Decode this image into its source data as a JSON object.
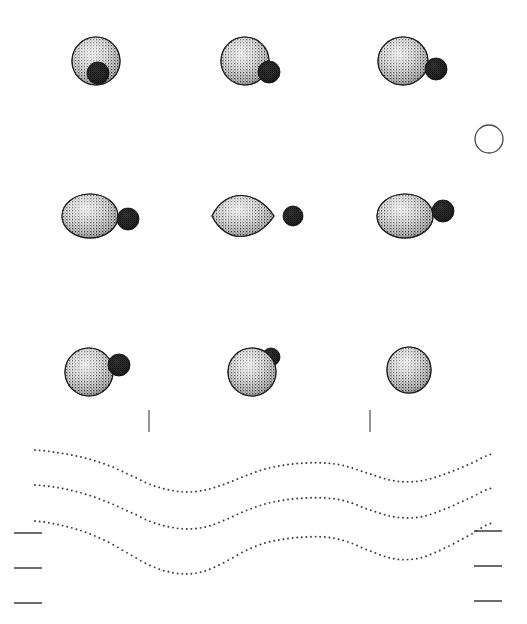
{
  "figure": {
    "title": "",
    "background_color": "#ffffff",
    "width": 527,
    "height": 624,
    "body_fill_color": "#b9b9b9",
    "body_stroke_color": "#1a1a1a",
    "companion_fill_color": "#0d0d0d",
    "companion_stroke_color": "#000000",
    "reference_circle_stroke_color": "#4a4a4a",
    "tick_color": "#3a3a3a",
    "curve_dot_color": "#333333"
  },
  "panels": [
    {
      "id": "panel-r1c1",
      "label": "row-1-col-1",
      "row": 1,
      "column": 1,
      "primary": {
        "cx": 96,
        "cy": 61,
        "rx": 24,
        "ry": 24,
        "rotation": 0,
        "shading": "dithered-sphere"
      },
      "companion": {
        "cx": 98,
        "cy": 73,
        "r": 11,
        "visible": true,
        "occluded": true
      },
      "companion_position": "bottom-center"
    },
    {
      "id": "panel-r1c2",
      "label": "row-1-col-2",
      "row": 1,
      "column": 2,
      "primary": {
        "cx": 245,
        "cy": 61,
        "rx": 24,
        "ry": 24,
        "rotation": 0,
        "shading": "dithered-sphere"
      },
      "companion": {
        "cx": 269,
        "cy": 72,
        "r": 11,
        "visible": true,
        "occluded": false
      },
      "companion_position": "bottom-right"
    },
    {
      "id": "panel-r1c3",
      "label": "row-1-col-3",
      "row": 1,
      "column": 3,
      "primary": {
        "cx": 403,
        "cy": 61,
        "rx": 25,
        "ry": 24,
        "rotation": 0,
        "shading": "dithered-sphere"
      },
      "companion": {
        "cx": 436,
        "cy": 69,
        "r": 11,
        "visible": true,
        "occluded": false
      },
      "companion_position": "right-lower"
    },
    {
      "id": "panel-r2c1",
      "label": "row-2-col-1",
      "row": 2,
      "column": 1,
      "primary": {
        "cx": 90,
        "cy": 216,
        "rx": 28,
        "ry": 22,
        "rotation": 0,
        "shading": "dithered-ellipsoid"
      },
      "companion": {
        "cx": 128,
        "cy": 219,
        "r": 11,
        "visible": true,
        "occluded": false
      },
      "companion_position": "right-detached"
    },
    {
      "id": "panel-r2c2",
      "label": "row-2-col-2",
      "row": 2,
      "column": 2,
      "primary": {
        "cx": 243,
        "cy": 216,
        "rx": 31,
        "ry": 22,
        "rotation": 0,
        "shading": "dithered-lens"
      },
      "companion": {
        "cx": 293,
        "cy": 216,
        "r": 10,
        "visible": true,
        "occluded": false
      },
      "companion_position": "right-detached"
    },
    {
      "id": "panel-r2c3",
      "label": "row-2-col-3",
      "row": 2,
      "column": 3,
      "primary": {
        "cx": 405,
        "cy": 216,
        "rx": 28,
        "ry": 22,
        "rotation": 0,
        "shading": "dithered-ellipsoid"
      },
      "companion": {
        "cx": 443,
        "cy": 211,
        "r": 11,
        "visible": true,
        "occluded": false
      },
      "companion_position": "right-detached-upper"
    },
    {
      "id": "panel-r3c1",
      "label": "row-3-col-1",
      "row": 3,
      "column": 1,
      "primary": {
        "cx": 89,
        "cy": 372,
        "rx": 24,
        "ry": 24,
        "rotation": 0,
        "shading": "dithered-sphere"
      },
      "companion": {
        "cx": 119,
        "cy": 365,
        "r": 11,
        "visible": true,
        "occluded": false
      },
      "companion_position": "upper-right"
    },
    {
      "id": "panel-r3c2",
      "label": "row-3-col-2",
      "row": 3,
      "column": 2,
      "primary": {
        "cx": 252,
        "cy": 372,
        "rx": 24,
        "ry": 24,
        "rotation": 0,
        "shading": "dithered-sphere"
      },
      "companion": {
        "cx": 271,
        "cy": 357,
        "r": 9,
        "visible": true,
        "occluded": true
      },
      "companion_position": "top-right-contact"
    },
    {
      "id": "panel-r3c3",
      "label": "row-3-col-3",
      "row": 3,
      "column": 3,
      "primary": {
        "cx": 409,
        "cy": 370,
        "rx": 22,
        "ry": 23,
        "rotation": 0,
        "shading": "dithered-sphere"
      },
      "companion": {
        "cx": 0,
        "cy": 0,
        "r": 0,
        "visible": false,
        "occluded": true
      },
      "companion_position": "hidden"
    }
  ],
  "reference_circle": {
    "label": "reference-scale-circle",
    "cx": 489,
    "cy": 139,
    "r": 14,
    "stroke_width": 1.3,
    "filled": false
  },
  "vertical_ticks": [
    {
      "label": "vertical-tick-left",
      "x": 149,
      "y_top": 410,
      "y_bottom": 432
    },
    {
      "label": "vertical-tick-right",
      "x": 370,
      "y_top": 410,
      "y_bottom": 432
    }
  ],
  "horizontal_ticks_left": [
    {
      "label": "left-tick-1",
      "x_start": 14,
      "x_end": 42,
      "y": 533
    },
    {
      "label": "left-tick-2",
      "x_start": 14,
      "x_end": 42,
      "y": 568
    },
    {
      "label": "left-tick-3",
      "x_start": 14,
      "x_end": 42,
      "y": 603
    }
  ],
  "horizontal_ticks_right": [
    {
      "label": "right-tick-1",
      "x_start": 474,
      "x_end": 502,
      "y": 531
    },
    {
      "label": "right-tick-2",
      "x_start": 474,
      "x_end": 502,
      "y": 566
    },
    {
      "label": "right-tick-3",
      "x_start": 474,
      "x_end": 502,
      "y": 601
    }
  ],
  "chart_data": {
    "type": "line",
    "title": "",
    "subtitle": "",
    "xlabel": "",
    "ylabel": "",
    "grid": false,
    "legend_position": "none",
    "xlim": [
      35,
      492
    ],
    "ylim": [
      450,
      600
    ],
    "annotation": "Three dotted contour curves with a W-shaped double minimum profile",
    "series": [
      {
        "name": "contour-top",
        "style": "dotted",
        "dot_radius": 0.95,
        "dot_spacing": 4.6,
        "x": [
          35,
          60,
          85,
          110,
          135,
          149,
          165,
          185,
          205,
          225,
          245,
          265,
          285,
          305,
          325,
          345,
          370,
          395,
          420,
          445,
          470,
          492
        ],
        "y": [
          450,
          453,
          458,
          466,
          477,
          484,
          489,
          492,
          490,
          484,
          476,
          469,
          465,
          463,
          463,
          466,
          474,
          481,
          481,
          474,
          464,
          454
        ]
      },
      {
        "name": "contour-middle",
        "style": "dotted",
        "dot_radius": 0.95,
        "dot_spacing": 4.6,
        "x": [
          35,
          60,
          85,
          110,
          135,
          149,
          165,
          185,
          205,
          225,
          245,
          265,
          285,
          305,
          325,
          345,
          370,
          395,
          420,
          445,
          470,
          492
        ],
        "y": [
          485,
          488,
          494,
          503,
          514,
          521,
          526,
          529,
          527,
          520,
          511,
          504,
          500,
          498,
          498,
          501,
          510,
          517,
          517,
          509,
          498,
          488
        ]
      },
      {
        "name": "contour-bottom",
        "style": "dotted",
        "dot_radius": 0.95,
        "dot_spacing": 4.6,
        "x": [
          35,
          60,
          85,
          110,
          135,
          149,
          165,
          185,
          205,
          225,
          245,
          265,
          285,
          305,
          325,
          345,
          370,
          395,
          420,
          445,
          470,
          492
        ],
        "y": [
          521,
          525,
          532,
          543,
          557,
          565,
          571,
          574,
          571,
          562,
          551,
          543,
          539,
          537,
          537,
          541,
          551,
          559,
          558,
          548,
          535,
          523
        ]
      }
    ]
  }
}
